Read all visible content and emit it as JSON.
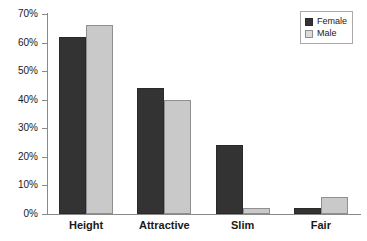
{
  "chart_data": {
    "type": "bar",
    "title": "",
    "subtitle": "",
    "xlabel": "",
    "ylabel": "",
    "categories": [
      "Height",
      "Attractive",
      "Slim",
      "Fair"
    ],
    "series": [
      {
        "name": "Female",
        "color": "#333333",
        "values": [
          62,
          44,
          24,
          2
        ]
      },
      {
        "name": "Male",
        "color": "#c9c9c9",
        "values": [
          66,
          40,
          2,
          6
        ]
      }
    ],
    "ylim": [
      0,
      70
    ],
    "ytick_values": [
      0,
      10,
      20,
      30,
      40,
      50,
      60,
      70
    ],
    "ytick_labels": [
      "0%",
      "10%",
      "20%",
      "30%",
      "40%",
      "50%",
      "60%",
      "70%"
    ],
    "grid": false,
    "legend_position": "top-right",
    "value_suffix": "%"
  },
  "legend": {
    "items": [
      {
        "label": "Female",
        "swatch": "female-swatch"
      },
      {
        "label": "Male",
        "swatch": "male-swatch"
      }
    ]
  },
  "axis": {
    "line_color": "#8a8a8a"
  }
}
